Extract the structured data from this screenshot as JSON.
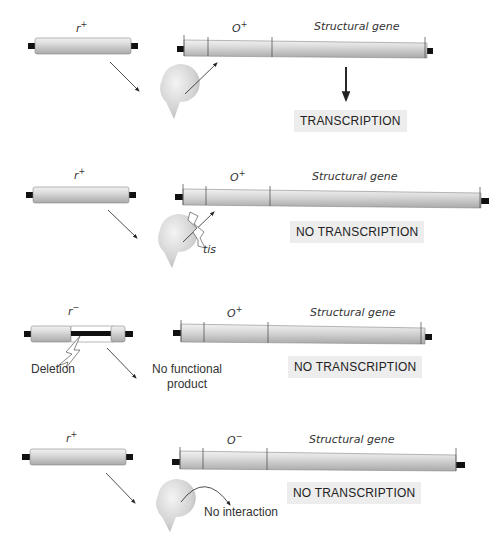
{
  "panels": [
    {
      "regulator": {
        "label": "r",
        "sup": "+"
      },
      "operator": {
        "label": "O",
        "sup": "+"
      },
      "structural": "Structural gene",
      "result": "TRANSCRIPTION",
      "note": ""
    },
    {
      "regulator": {
        "label": "r",
        "sup": "+"
      },
      "operator": {
        "label": "O",
        "sup": "+"
      },
      "structural": "Structural gene",
      "result": "NO TRANSCRIPTION",
      "note": "tis"
    },
    {
      "regulator": {
        "label": "r",
        "sup": "−"
      },
      "operator": {
        "label": "O",
        "sup": "+"
      },
      "structural": "Structural gene",
      "result": "NO TRANSCRIPTION",
      "note": "Deletion",
      "note2_line1": "No functional",
      "note2_line2": "product"
    },
    {
      "regulator": {
        "label": "r",
        "sup": "+"
      },
      "operator": {
        "label": "O",
        "sup": "−"
      },
      "structural": "Structural gene",
      "result": "NO TRANSCRIPTION",
      "note": "No interaction"
    }
  ],
  "colors": {
    "rod_light": "#e2e2e2",
    "rod_dark": "#a8a8a8",
    "cap": "#111111",
    "repressor": "#d4d4d4",
    "label_box": "#ededed"
  }
}
